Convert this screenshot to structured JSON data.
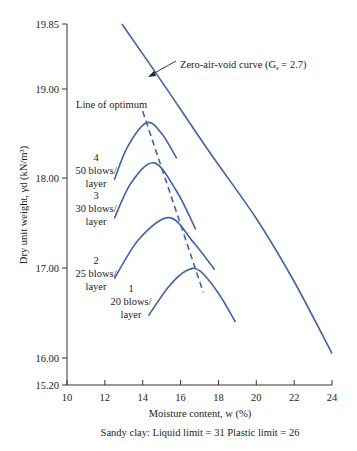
{
  "chart_data": {
    "type": "line",
    "title": "",
    "xlabel": "Moisture content, w (%)",
    "ylabel": "Dry unit weight, γd (kN/m³)",
    "caption": "Sandy clay: Liquid limit = 31 Plastic limit = 26",
    "xlim": [
      10,
      24
    ],
    "ylim": [
      15.2,
      19.85
    ],
    "x_ticks": [
      10,
      12,
      14,
      16,
      18,
      20,
      22,
      24
    ],
    "y_ticks": [
      "15.20",
      "16.00",
      "17.00",
      "18.00",
      "19.00",
      "19.85"
    ],
    "grid": false,
    "series": [
      {
        "name": "Zero-air-void curve (Gs = 2.7)",
        "style": "solid",
        "points": [
          [
            12.9,
            19.85
          ],
          [
            15.0,
            19.1
          ],
          [
            17.5,
            18.3
          ],
          [
            20.0,
            17.55
          ],
          [
            22.0,
            16.85
          ],
          [
            24.0,
            16.05
          ]
        ]
      },
      {
        "name": "4 50 blows/layer",
        "style": "solid",
        "points": [
          [
            12.5,
            17.98
          ],
          [
            13.2,
            18.35
          ],
          [
            14.2,
            18.62
          ],
          [
            15.0,
            18.5
          ],
          [
            15.8,
            18.22
          ]
        ]
      },
      {
        "name": "3 30 blows/layer",
        "style": "solid",
        "points": [
          [
            12.5,
            17.55
          ],
          [
            13.4,
            17.95
          ],
          [
            14.6,
            18.17
          ],
          [
            15.8,
            17.85
          ],
          [
            16.8,
            17.43
          ]
        ]
      },
      {
        "name": "2 25 blows/layer",
        "style": "solid",
        "points": [
          [
            12.5,
            16.88
          ],
          [
            13.8,
            17.32
          ],
          [
            15.4,
            17.56
          ],
          [
            16.7,
            17.28
          ],
          [
            17.8,
            16.98
          ]
        ]
      },
      {
        "name": "1 20 blows/layer",
        "style": "solid",
        "points": [
          [
            14.3,
            16.47
          ],
          [
            15.4,
            16.8
          ],
          [
            16.3,
            16.97
          ],
          [
            17.0,
            16.97
          ],
          [
            18.0,
            16.72
          ],
          [
            18.9,
            16.4
          ]
        ]
      },
      {
        "name": "Line of optimum",
        "style": "dashed",
        "points": [
          [
            14.0,
            18.75
          ],
          [
            17.2,
            16.73
          ]
        ]
      }
    ],
    "annotations": [
      {
        "text": "Zero-air-void curve (G",
        "sub": "s",
        "tail": " = 2.7)"
      },
      {
        "text": "Line of optimum"
      },
      {
        "lines": [
          "4",
          "50 blows/",
          "layer"
        ]
      },
      {
        "lines": [
          "3",
          "30 blows/",
          "layer"
        ]
      },
      {
        "lines": [
          "2",
          "25 blows/",
          "layer"
        ]
      },
      {
        "lines": [
          "1",
          "20 blows/",
          "layer"
        ]
      }
    ]
  }
}
